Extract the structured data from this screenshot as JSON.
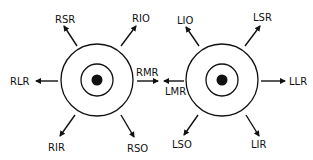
{
  "diagram": {
    "right_eye": {
      "labels": {
        "superior_left": "RSR",
        "superior_right": "RIO",
        "lateral": "RLR",
        "medial": "RMR",
        "inferior_left": "RIR",
        "inferior_right": "RSO"
      }
    },
    "left_eye": {
      "labels": {
        "superior_left": "LIO",
        "superior_right": "LSR",
        "medial": "LMR",
        "lateral": "LLR",
        "inferior_left": "LSO",
        "inferior_right": "LIR"
      }
    },
    "colors": {
      "line": "#111111",
      "background": "#ffffff"
    }
  }
}
